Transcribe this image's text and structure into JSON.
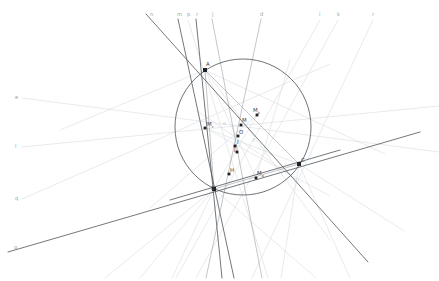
{
  "figure": {
    "width": 439,
    "height": 281,
    "background": "#ffffff"
  },
  "colors": {
    "circle": "#55595e",
    "strong_line": "#5a5e63",
    "medium_line": "#9aa0a6",
    "faint_line": "#d4d8dc",
    "very_faint_line": "#e4e7ea",
    "point_fill": "#202124",
    "label_strong": "#3c4043",
    "label_faint": "#9aa0a6"
  },
  "circle": {
    "label": "circumcircle",
    "cx": 243,
    "cy": 127,
    "r": 68
  },
  "vertices": [
    {
      "name": "A",
      "label": "A",
      "sub": "",
      "x": 205,
      "y": 70,
      "lx": 206,
      "ly": 66
    },
    {
      "name": "B",
      "label": "B",
      "sub": "",
      "x": 214,
      "y": 189,
      "lx": 211,
      "ly": 190
    },
    {
      "name": "C",
      "label": "C",
      "sub": "",
      "x": 299,
      "y": 164,
      "lx": 301,
      "ly": 162
    }
  ],
  "points": [
    {
      "name": "M_c",
      "label": "M",
      "sub": "c",
      "x": 205,
      "y": 128,
      "lx": 207,
      "ly": 126
    },
    {
      "name": "M_b",
      "label": "M",
      "sub": "b",
      "x": 257,
      "y": 115,
      "lx": 253,
      "ly": 112
    },
    {
      "name": "M_a",
      "label": "M",
      "sub": "a",
      "x": 256,
      "y": 178,
      "lx": 257,
      "ly": 175
    },
    {
      "name": "M",
      "label": "M",
      "sub": "",
      "x": 241,
      "y": 125,
      "lx": 242,
      "ly": 122
    },
    {
      "name": "O",
      "label": "O",
      "sub": "",
      "x": 238,
      "y": 136,
      "lx": 239,
      "ly": 134
    },
    {
      "name": "I",
      "label": "I",
      "sub": "",
      "x": 235,
      "y": 146,
      "lx": 237,
      "ly": 144
    },
    {
      "name": "J",
      "label": "J",
      "sub": "",
      "x": 237,
      "y": 152,
      "lx": 234,
      "ly": 151
    },
    {
      "name": "H",
      "label": "H",
      "sub": "",
      "x": 229,
      "y": 174,
      "lx": 230,
      "ly": 172
    }
  ],
  "point_label_extra": [
    {
      "name": "label-e-center",
      "text": "e",
      "x": 223,
      "y": 125
    },
    {
      "name": "label-f-center",
      "text": "f",
      "x": 253,
      "y": 142
    }
  ],
  "top_labels": [
    {
      "name": "line-label-n",
      "text": "n",
      "x": 150,
      "y": 16
    },
    {
      "name": "line-label-m",
      "text": "m",
      "x": 177,
      "y": 16
    },
    {
      "name": "line-label-p",
      "text": "p",
      "x": 187,
      "y": 16
    },
    {
      "name": "line-label-r",
      "text": "r",
      "x": 196,
      "y": 16
    },
    {
      "name": "line-label-j",
      "text": "j",
      "x": 212,
      "y": 16
    },
    {
      "name": "line-label-d",
      "text": "d",
      "x": 260,
      "y": 16
    },
    {
      "name": "line-label-i",
      "text": "i",
      "x": 319,
      "y": 16
    },
    {
      "name": "line-label-k",
      "text": "k",
      "x": 337,
      "y": 16
    },
    {
      "name": "line-label-r2",
      "text": "r",
      "x": 372,
      "y": 16
    }
  ],
  "left_labels": [
    {
      "name": "line-label-e",
      "text": "e",
      "x": 15,
      "y": 99
    },
    {
      "name": "line-label-l",
      "text": "l",
      "x": 15,
      "y": 148
    },
    {
      "name": "line-label-q",
      "text": "q",
      "x": 15,
      "y": 200
    },
    {
      "name": "line-label-g",
      "text": "g",
      "x": 14,
      "y": 249
    }
  ],
  "lines_strong": [
    {
      "name": "line-n-through-A",
      "x1": 146,
      "y1": 14,
      "x2": 368,
      "y2": 262
    },
    {
      "name": "line-g-baseline",
      "x1": 8,
      "y1": 252,
      "x2": 420,
      "y2": 132
    },
    {
      "name": "line-r-altitude",
      "x1": 196,
      "y1": 19,
      "x2": 222,
      "y2": 278
    },
    {
      "name": "line-m-cevian",
      "x1": 178,
      "y1": 19,
      "x2": 234,
      "y2": 278
    },
    {
      "name": "line-BC-extended",
      "x1": 170,
      "y1": 200,
      "x2": 340,
      "y2": 150
    }
  ],
  "lines_medium": [
    {
      "name": "line-AB",
      "x1": 205,
      "y1": 70,
      "x2": 214,
      "y2": 189
    },
    {
      "name": "line-AC",
      "x1": 205,
      "y1": 70,
      "x2": 299,
      "y2": 164
    },
    {
      "name": "line-BC",
      "x1": 214,
      "y1": 189,
      "x2": 299,
      "y2": 164
    },
    {
      "name": "line-d-cevian",
      "x1": 261,
      "y1": 19,
      "x2": 206,
      "y2": 278
    },
    {
      "name": "line-j-cevian",
      "x1": 212,
      "y1": 19,
      "x2": 262,
      "y2": 278
    }
  ],
  "lines_faint": [
    {
      "name": "line-p-faint",
      "x1": 188,
      "y1": 20,
      "x2": 268,
      "y2": 278
    },
    {
      "name": "line-i-faint",
      "x1": 320,
      "y1": 20,
      "x2": 176,
      "y2": 278
    },
    {
      "name": "line-k-faint",
      "x1": 338,
      "y1": 20,
      "x2": 196,
      "y2": 278
    },
    {
      "name": "line-r2-faint",
      "x1": 373,
      "y1": 20,
      "x2": 252,
      "y2": 278
    },
    {
      "name": "line-e-left",
      "x1": 22,
      "y1": 98,
      "x2": 439,
      "y2": 152
    },
    {
      "name": "line-l-left",
      "x1": 22,
      "y1": 147,
      "x2": 439,
      "y2": 106
    },
    {
      "name": "line-q-left",
      "x1": 22,
      "y1": 199,
      "x2": 330,
      "y2": 64
    },
    {
      "name": "line-median-Mc-C",
      "x1": 205,
      "y1": 128,
      "x2": 299,
      "y2": 164
    },
    {
      "name": "line-median-Mb-B",
      "x1": 257,
      "y1": 115,
      "x2": 214,
      "y2": 189
    },
    {
      "name": "line-median-Ma-A",
      "x1": 256,
      "y1": 178,
      "x2": 205,
      "y2": 70
    },
    {
      "name": "line-bisector-a",
      "x1": 205,
      "y1": 128,
      "x2": 330,
      "y2": 196
    },
    {
      "name": "line-bisector-b",
      "x1": 257,
      "y1": 115,
      "x2": 150,
      "y2": 208
    },
    {
      "name": "line-bisector-c",
      "x1": 256,
      "y1": 178,
      "x2": 290,
      "y2": 60
    },
    {
      "name": "line-B-fan-1",
      "x1": 214,
      "y1": 189,
      "x2": 105,
      "y2": 278
    },
    {
      "name": "line-B-fan-2",
      "x1": 214,
      "y1": 189,
      "x2": 140,
      "y2": 278
    },
    {
      "name": "line-B-fan-3",
      "x1": 214,
      "y1": 189,
      "x2": 172,
      "y2": 278
    },
    {
      "name": "line-B-fan-4",
      "x1": 214,
      "y1": 189,
      "x2": 316,
      "y2": 278
    },
    {
      "name": "line-C-fan-1",
      "x1": 299,
      "y1": 164,
      "x2": 404,
      "y2": 231
    },
    {
      "name": "line-C-fan-2",
      "x1": 299,
      "y1": 164,
      "x2": 350,
      "y2": 278
    },
    {
      "name": "line-C-fan-3",
      "x1": 299,
      "y1": 164,
      "x2": 281,
      "y2": 278
    },
    {
      "name": "line-A-fan-1",
      "x1": 205,
      "y1": 70,
      "x2": 385,
      "y2": 154
    },
    {
      "name": "line-A-fan-2",
      "x1": 205,
      "y1": 70,
      "x2": 60,
      "y2": 130
    },
    {
      "name": "line-A-fan-3",
      "x1": 205,
      "y1": 70,
      "x2": 330,
      "y2": 240
    },
    {
      "name": "line-euler",
      "x1": 196,
      "y1": 110,
      "x2": 300,
      "y2": 182
    }
  ]
}
